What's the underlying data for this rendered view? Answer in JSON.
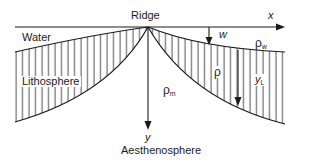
{
  "diagram": {
    "type": "cross-section",
    "labels": {
      "ridge": "Ridge",
      "water": "Water",
      "lithosphere": "Lithosphere",
      "aesthenosphere": "Aesthenosphere",
      "x_axis": "x",
      "y_axis": "y",
      "w": "w",
      "rho": "ρ",
      "rho_w_base": "ρ",
      "rho_w_sub": "w",
      "rho_m_base": "ρ",
      "rho_m_sub": "m",
      "yL_base": "y",
      "yL_sub": "L"
    },
    "colors": {
      "line": "#1a1a1a",
      "background": "#ffffff"
    }
  }
}
